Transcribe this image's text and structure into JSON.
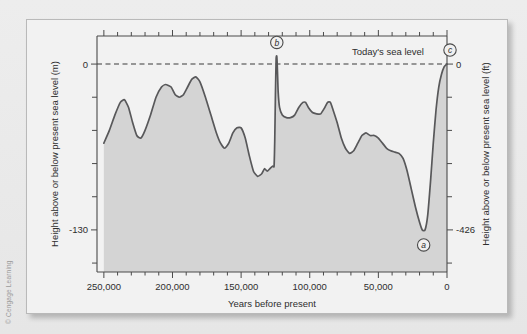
{
  "figure": {
    "credit": "© Cengage Learning"
  },
  "chart_data": {
    "type": "area",
    "title": "",
    "xlabel": "Years before present",
    "ylabel_left": "Height above or below present sea level (m)",
    "ylabel_right": "Height above or below present sea level (ft)",
    "x_ticklabels": [
      "250,000",
      "200,000",
      "150,000",
      "100,000",
      "50,000",
      "0"
    ],
    "x_tickvalues": [
      250000,
      200000,
      150000,
      100000,
      50000,
      0
    ],
    "xlim": [
      255000,
      0
    ],
    "x_minor_tick_interval": 10000,
    "y_left_ticklabels": [
      "0",
      "-130"
    ],
    "y_left_tickvalues": [
      0,
      -130
    ],
    "ylim_left": [
      -163,
      22
    ],
    "y_right_ticklabels": [
      "0",
      "-426"
    ],
    "y_right_tickvalues": [
      0,
      -426
    ],
    "ylim_right": [
      -535,
      72
    ],
    "y_minor_tick_interval_m": 26,
    "grid": false,
    "legend": "none",
    "zero_reference": {
      "label": "Today's sea level",
      "value_m": 0,
      "style": "dashed"
    },
    "annotations": [
      {
        "id": "a",
        "label": "a",
        "x": 17000,
        "y_m": -130,
        "note": "lowest sea level, last glacial maximum"
      },
      {
        "id": "b",
        "label": "b",
        "x": 124000,
        "y_m": 6,
        "note": "last interglacial highstand above today's level"
      },
      {
        "id": "c",
        "label": "c",
        "x": 2000,
        "y_m": 0,
        "note": "today's sea level"
      }
    ],
    "series": [
      {
        "name": "Sea level (m relative to present)",
        "color": "#58585a",
        "fill": "#d3d3d3",
        "points": [
          [
            250000,
            -62
          ],
          [
            246000,
            -52
          ],
          [
            242000,
            -40
          ],
          [
            238000,
            -30
          ],
          [
            235000,
            -28
          ],
          [
            232000,
            -34
          ],
          [
            229000,
            -46
          ],
          [
            226000,
            -56
          ],
          [
            223000,
            -58
          ],
          [
            220000,
            -52
          ],
          [
            216000,
            -40
          ],
          [
            212000,
            -26
          ],
          [
            208000,
            -18
          ],
          [
            205000,
            -16
          ],
          [
            201000,
            -18
          ],
          [
            198000,
            -24
          ],
          [
            195000,
            -26
          ],
          [
            192000,
            -24
          ],
          [
            189000,
            -18
          ],
          [
            186000,
            -12
          ],
          [
            183000,
            -10
          ],
          [
            180000,
            -14
          ],
          [
            176000,
            -26
          ],
          [
            172000,
            -40
          ],
          [
            168000,
            -54
          ],
          [
            165000,
            -62
          ],
          [
            162000,
            -66
          ],
          [
            159000,
            -62
          ],
          [
            156000,
            -54
          ],
          [
            153000,
            -50
          ],
          [
            150000,
            -50
          ],
          [
            147000,
            -58
          ],
          [
            144000,
            -72
          ],
          [
            141000,
            -84
          ],
          [
            138000,
            -88
          ],
          [
            135000,
            -86
          ],
          [
            133000,
            -82
          ],
          [
            131000,
            -84
          ],
          [
            129000,
            -82
          ],
          [
            127000,
            -80
          ],
          [
            126000,
            -80
          ],
          [
            125500,
            -60
          ],
          [
            125000,
            -24
          ],
          [
            124500,
            4
          ],
          [
            124000,
            6
          ],
          [
            123500,
            -6
          ],
          [
            123000,
            -22
          ],
          [
            122000,
            -34
          ],
          [
            120000,
            -40
          ],
          [
            117000,
            -42
          ],
          [
            114000,
            -42
          ],
          [
            111000,
            -40
          ],
          [
            108000,
            -34
          ],
          [
            105000,
            -30
          ],
          [
            103000,
            -30
          ],
          [
            101000,
            -34
          ],
          [
            98000,
            -38
          ],
          [
            95000,
            -39
          ],
          [
            92000,
            -39
          ],
          [
            89000,
            -34
          ],
          [
            87000,
            -30
          ],
          [
            85000,
            -30
          ],
          [
            83000,
            -36
          ],
          [
            80000,
            -46
          ],
          [
            77000,
            -58
          ],
          [
            74000,
            -66
          ],
          [
            71000,
            -70
          ],
          [
            68000,
            -68
          ],
          [
            65000,
            -62
          ],
          [
            62000,
            -56
          ],
          [
            59000,
            -54
          ],
          [
            56000,
            -56
          ],
          [
            53000,
            -56
          ],
          [
            50000,
            -58
          ],
          [
            47000,
            -62
          ],
          [
            44000,
            -66
          ],
          [
            41000,
            -68
          ],
          [
            38000,
            -69
          ],
          [
            35000,
            -70
          ],
          [
            32000,
            -74
          ],
          [
            29000,
            -84
          ],
          [
            26000,
            -98
          ],
          [
            23000,
            -112
          ],
          [
            20000,
            -124
          ],
          [
            18000,
            -130
          ],
          [
            16000,
            -130
          ],
          [
            14000,
            -118
          ],
          [
            12000,
            -92
          ],
          [
            10000,
            -62
          ],
          [
            8000,
            -36
          ],
          [
            6000,
            -18
          ],
          [
            4000,
            -8
          ],
          [
            2000,
            -2
          ],
          [
            0,
            0
          ]
        ]
      }
    ]
  }
}
